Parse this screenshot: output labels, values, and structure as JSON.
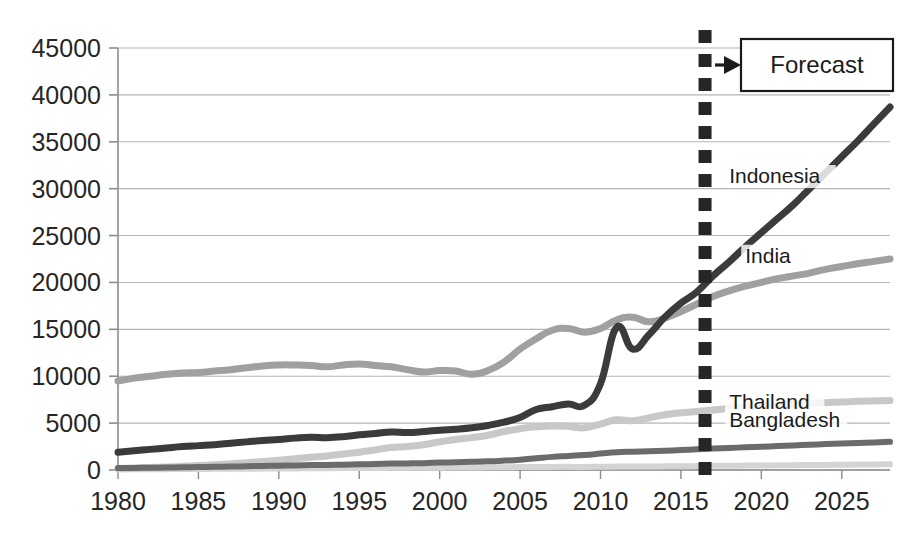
{
  "chart_data": {
    "type": "line",
    "title": "",
    "subtitle": "",
    "xlabel": "",
    "ylabel": "",
    "xlim": [
      1980,
      2028
    ],
    "ylim": [
      0,
      45000
    ],
    "grid": true,
    "legend_position": "inline-right-labels",
    "y_ticks": [
      0,
      5000,
      10000,
      15000,
      20000,
      25000,
      30000,
      35000,
      40000,
      45000
    ],
    "y_tick_labels": [
      "0",
      "5000",
      "10000",
      "15000",
      "20000",
      "25000",
      "30000",
      "35000",
      "40000",
      "45000"
    ],
    "x_ticks": [
      1980,
      1985,
      1990,
      1995,
      2000,
      2005,
      2010,
      2015,
      2020,
      2025
    ],
    "x_tick_labels": [
      "1980",
      "1985",
      "1990",
      "1995",
      "2000",
      "2005",
      "2010",
      "2015",
      "2020",
      "2025"
    ],
    "x": [
      1980,
      1981,
      1982,
      1983,
      1984,
      1985,
      1986,
      1987,
      1988,
      1989,
      1990,
      1991,
      1992,
      1993,
      1994,
      1995,
      1996,
      1997,
      1998,
      1999,
      2000,
      2001,
      2002,
      2003,
      2004,
      2005,
      2006,
      2007,
      2008,
      2009,
      2010,
      2011,
      2012,
      2013,
      2014,
      2015,
      2016,
      2017,
      2018,
      2019,
      2020,
      2021,
      2022,
      2023,
      2024,
      2025,
      2026,
      2027,
      2028
    ],
    "forecast_start_year": 2016.5,
    "series": [
      {
        "name": "Indonesia",
        "color": "#3b3b3b",
        "width": 7,
        "label_x": 2018,
        "label_y": 30600,
        "values": [
          1900,
          2050,
          2200,
          2350,
          2500,
          2600,
          2700,
          2850,
          3000,
          3150,
          3250,
          3400,
          3500,
          3450,
          3550,
          3750,
          3900,
          4050,
          4000,
          4100,
          4250,
          4350,
          4500,
          4750,
          5100,
          5600,
          6450,
          6750,
          7050,
          6900,
          9200,
          15200,
          12900,
          14400,
          16300,
          17800,
          19000,
          20700,
          22200,
          23800,
          25300,
          26800,
          28300,
          30000,
          31700,
          33400,
          35100,
          36900,
          38700
        ]
      },
      {
        "name": "India",
        "color": "#a0a0a0",
        "width": 7,
        "label_x": 2019,
        "label_y": 22100,
        "values": [
          9500,
          9800,
          10000,
          10200,
          10350,
          10400,
          10550,
          10700,
          10900,
          11100,
          11200,
          11200,
          11150,
          11000,
          11200,
          11300,
          11150,
          11000,
          10700,
          10450,
          10600,
          10550,
          10200,
          10600,
          11500,
          12900,
          14000,
          14900,
          15100,
          14700,
          15100,
          16000,
          16300,
          15800,
          16200,
          16900,
          17700,
          18500,
          19100,
          19600,
          20000,
          20400,
          20700,
          21000,
          21400,
          21700,
          22000,
          22250,
          22500
        ]
      },
      {
        "name": "Thailand",
        "color": "#c8c8c8",
        "width": 7,
        "label_x": 2018,
        "label_y": 6500,
        "values": [
          150,
          200,
          260,
          320,
          400,
          480,
          560,
          660,
          780,
          900,
          1050,
          1200,
          1350,
          1500,
          1700,
          1900,
          2150,
          2400,
          2500,
          2700,
          3000,
          3250,
          3450,
          3700,
          4100,
          4400,
          4600,
          4700,
          4650,
          4500,
          4900,
          5350,
          5250,
          5550,
          5900,
          6100,
          6250,
          6400,
          6550,
          6700,
          6800,
          6900,
          7000,
          7100,
          7180,
          7250,
          7320,
          7360,
          7400
        ]
      },
      {
        "name": "Bangladesh",
        "color": "#6b6b6b",
        "width": 6,
        "label_x": 2018,
        "label_y": 4600,
        "values": [
          200,
          220,
          240,
          260,
          290,
          310,
          340,
          370,
          400,
          430,
          460,
          490,
          520,
          540,
          570,
          600,
          640,
          680,
          700,
          730,
          790,
          830,
          870,
          920,
          1000,
          1100,
          1250,
          1400,
          1500,
          1600,
          1750,
          1900,
          1950,
          2000,
          2050,
          2120,
          2200,
          2280,
          2350,
          2420,
          2480,
          2550,
          2620,
          2700,
          2760,
          2820,
          2880,
          2940,
          3000
        ]
      },
      {
        "name": "Other",
        "color": "#d4d4d4",
        "width": 6,
        "label_x": null,
        "label_y": null,
        "values": [
          60,
          70,
          80,
          90,
          100,
          110,
          120,
          130,
          140,
          150,
          160,
          170,
          180,
          190,
          200,
          210,
          220,
          230,
          235,
          240,
          250,
          260,
          270,
          280,
          295,
          310,
          320,
          330,
          335,
          330,
          345,
          360,
          370,
          380,
          390,
          400,
          420,
          440,
          455,
          470,
          485,
          500,
          515,
          530,
          545,
          560,
          575,
          590,
          600
        ]
      }
    ],
    "annotations": [
      {
        "name": "forecast-divider",
        "type": "vline",
        "x": 2016.5,
        "color": "#262626",
        "style": "dotted-square"
      },
      {
        "name": "forecast-callout",
        "type": "box-with-arrow",
        "text": "Forecast",
        "color": "#1b1b1b"
      }
    ]
  },
  "forecast": {
    "label": "Forecast"
  },
  "series_labels": {
    "indonesia": "Indonesia",
    "india": "India",
    "thailand": "Thailand",
    "bangladesh": "Bangladesh"
  }
}
